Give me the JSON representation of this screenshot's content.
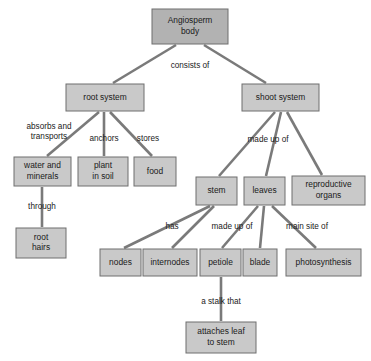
{
  "diagram": {
    "colors": {
      "root_fill": "#b2b2b2",
      "node_fill": "#c9c9c9",
      "node_stroke": "#6e6e6e",
      "edge_stroke": "#7a7a7a",
      "text": "#1a1a1a",
      "background": "#ffffff"
    },
    "nodes": [
      {
        "id": "angiosperm_body",
        "lines": [
          "Angiosperm",
          "body"
        ],
        "x": 152,
        "y": 9,
        "w": 76,
        "h": 35,
        "level": "root"
      },
      {
        "id": "root_system",
        "lines": [
          "root system"
        ],
        "x": 66,
        "y": 84,
        "w": 78,
        "h": 27,
        "level": "branch"
      },
      {
        "id": "shoot_system",
        "lines": [
          "shoot system"
        ],
        "x": 242,
        "y": 84,
        "w": 77,
        "h": 27,
        "level": "branch"
      },
      {
        "id": "water_and_minerals",
        "lines": [
          "water and",
          "minerals"
        ],
        "x": 14,
        "y": 157,
        "w": 57,
        "h": 29,
        "level": "leaf"
      },
      {
        "id": "plant_in_soil",
        "lines": [
          "plant",
          "in soil"
        ],
        "x": 78,
        "y": 157,
        "w": 50,
        "h": 29,
        "level": "leaf"
      },
      {
        "id": "food",
        "lines": [
          "food"
        ],
        "x": 134,
        "y": 157,
        "w": 42,
        "h": 29,
        "level": "leaf"
      },
      {
        "id": "root_hairs",
        "lines": [
          "root",
          "hairs"
        ],
        "x": 16,
        "y": 228,
        "w": 50,
        "h": 30,
        "level": "leaf"
      },
      {
        "id": "stem",
        "lines": [
          "stem"
        ],
        "x": 196,
        "y": 177,
        "w": 41,
        "h": 28,
        "level": "leaf"
      },
      {
        "id": "leaves",
        "lines": [
          "leaves"
        ],
        "x": 244,
        "y": 177,
        "w": 41,
        "h": 28,
        "level": "leaf"
      },
      {
        "id": "reproductive_organs",
        "lines": [
          "reproductive",
          "organs"
        ],
        "x": 292,
        "y": 176,
        "w": 73,
        "h": 29,
        "level": "leaf"
      },
      {
        "id": "nodes",
        "lines": [
          "nodes"
        ],
        "x": 100,
        "y": 249,
        "w": 41,
        "h": 27,
        "level": "leaf"
      },
      {
        "id": "internodes",
        "lines": [
          "internodes"
        ],
        "x": 143,
        "y": 249,
        "w": 54,
        "h": 27,
        "level": "leaf"
      },
      {
        "id": "petiole",
        "lines": [
          "petiole"
        ],
        "x": 200,
        "y": 249,
        "w": 41,
        "h": 27,
        "level": "leaf"
      },
      {
        "id": "blade",
        "lines": [
          "blade"
        ],
        "x": 243,
        "y": 249,
        "w": 34,
        "h": 27,
        "level": "leaf"
      },
      {
        "id": "photosynthesis",
        "lines": [
          "photosynthesis"
        ],
        "x": 286,
        "y": 249,
        "w": 75,
        "h": 27,
        "level": "leaf"
      },
      {
        "id": "attaches_leaf_to_stem",
        "lines": [
          "attaches leaf",
          "to stem"
        ],
        "x": 186,
        "y": 322,
        "w": 70,
        "h": 31,
        "level": "leaf"
      }
    ],
    "edges": [
      {
        "id": "body-to-root",
        "from": "angiosperm_body",
        "to": "root_system",
        "x1": 176,
        "y1": 45,
        "x2": 113,
        "y2": 83
      },
      {
        "id": "body-to-shoot",
        "from": "angiosperm_body",
        "to": "shoot_system",
        "x1": 204,
        "y1": 45,
        "x2": 266,
        "y2": 83
      },
      {
        "id": "root-to-water",
        "from": "root_system",
        "to": "water_and_minerals",
        "x1": 99,
        "y1": 112,
        "x2": 47,
        "y2": 156
      },
      {
        "id": "root-to-plant",
        "from": "root_system",
        "to": "plant_in_soil",
        "x1": 104,
        "y1": 112,
        "x2": 104,
        "y2": 156
      },
      {
        "id": "root-to-food",
        "from": "root_system",
        "to": "food",
        "x1": 110,
        "y1": 112,
        "x2": 152,
        "y2": 156
      },
      {
        "id": "water-to-roothairs",
        "from": "water_and_minerals",
        "to": "root_hairs",
        "x1": 42,
        "y1": 187,
        "x2": 42,
        "y2": 227
      },
      {
        "id": "shoot-to-stem",
        "from": "shoot_system",
        "to": "stem",
        "x1": 275,
        "y1": 112,
        "x2": 219,
        "y2": 176
      },
      {
        "id": "shoot-to-leaves",
        "from": "shoot_system",
        "to": "leaves",
        "x1": 281,
        "y1": 112,
        "x2": 266,
        "y2": 176
      },
      {
        "id": "shoot-to-reproductive",
        "from": "shoot_system",
        "to": "reproductive_organs",
        "x1": 287,
        "y1": 112,
        "x2": 322,
        "y2": 175
      },
      {
        "id": "stem-to-nodes",
        "from": "stem",
        "to": "nodes",
        "x1": 210,
        "y1": 206,
        "x2": 124,
        "y2": 248
      },
      {
        "id": "stem-to-internodes",
        "from": "stem",
        "to": "internodes",
        "x1": 214,
        "y1": 206,
        "x2": 172,
        "y2": 248
      },
      {
        "id": "leaves-to-petiole",
        "from": "leaves",
        "to": "petiole",
        "x1": 258,
        "y1": 206,
        "x2": 222,
        "y2": 248
      },
      {
        "id": "leaves-to-blade",
        "from": "leaves",
        "to": "blade",
        "x1": 264,
        "y1": 206,
        "x2": 260,
        "y2": 248
      },
      {
        "id": "leaves-to-photosynthesis",
        "from": "leaves",
        "to": "photosynthesis",
        "x1": 272,
        "y1": 206,
        "x2": 316,
        "y2": 248
      },
      {
        "id": "petiole-to-attaches",
        "from": "petiole",
        "to": "attaches_leaf_to_stem",
        "x1": 221,
        "y1": 277,
        "x2": 221,
        "y2": 321
      }
    ],
    "edge_labels": [
      {
        "id": "consists-of",
        "text": "consists of",
        "x": 190,
        "y": 66
      },
      {
        "id": "absorbs-and-transports",
        "lines": [
          "absorbs and",
          "transports"
        ],
        "x": 49,
        "y": 132
      },
      {
        "id": "anchors",
        "text": "anchors",
        "x": 104,
        "y": 139
      },
      {
        "id": "stores",
        "text": "stores",
        "x": 148,
        "y": 139
      },
      {
        "id": "through",
        "text": "through",
        "x": 42,
        "y": 207
      },
      {
        "id": "made-up-of-shoot",
        "text": "made up of",
        "x": 268,
        "y": 140
      },
      {
        "id": "has",
        "text": "has",
        "x": 172,
        "y": 227
      },
      {
        "id": "made-up-of-leaves",
        "text": "made up of",
        "x": 232,
        "y": 227
      },
      {
        "id": "main-site-of",
        "text": "main site of",
        "x": 307,
        "y": 227
      },
      {
        "id": "a-stalk-that",
        "text": "a stalk that",
        "x": 221,
        "y": 302
      }
    ]
  }
}
